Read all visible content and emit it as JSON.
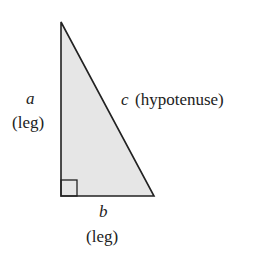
{
  "diagram": {
    "fill_color": "#e6e6e6",
    "stroke_color": "#222222",
    "labels": {
      "a_var": "a",
      "a_desc": "(leg)",
      "b_var": "b",
      "b_desc": "(leg)",
      "c_var": "c",
      "c_desc": "(hypotenuse)"
    }
  }
}
